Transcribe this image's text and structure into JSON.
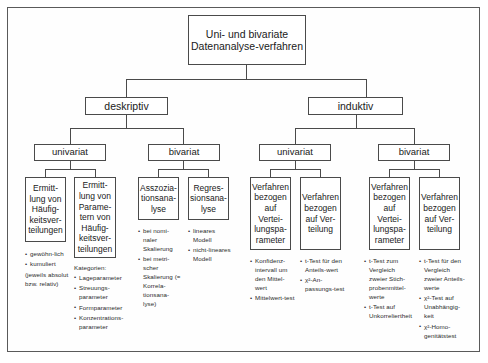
{
  "diagram": {
    "title_box": "Uni- und bivariate Datenanalyse-verfahren",
    "level1": [
      {
        "label": "deskriptiv"
      },
      {
        "label": "induktiv"
      }
    ],
    "level2": [
      {
        "label": "univariat"
      },
      {
        "label": "bivariat"
      },
      {
        "label": "univariat"
      },
      {
        "label": "bivariat"
      }
    ],
    "leaves": [
      {
        "label": "Ermitt-lung von Häufig-keitsver-teilungen"
      },
      {
        "label": "Ermitt-lung von Parame-tern von Häufig-keitsver-teilungen"
      },
      {
        "label": "Asszozia-tionsana-lyse"
      },
      {
        "label": "Regres-sionsana-lyse"
      },
      {
        "label": "Verfahren bezogen auf Vertei-lungspa-rameter"
      },
      {
        "label": "Verfahren bezogen auf Ver-teilung"
      },
      {
        "label": "Verfahren bezogen auf Vertei-lungspa-rameter"
      },
      {
        "label": "Verfahren bezogen auf Ver-teilung"
      }
    ],
    "notes": [
      {
        "heading": "",
        "items": [
          "gewöhn-lich",
          "kumuliert"
        ],
        "trailing": "(jeweils absolut bzw. relativ)"
      },
      {
        "heading": "Kategorien:",
        "items": [
          "Lageparameter",
          "Streuungs-parameter",
          "Formparameter",
          "Konzentrations-parameter"
        ],
        "trailing": ""
      },
      {
        "heading": "",
        "items": [
          "bei nomi-naler Skalierung",
          "bei metri-scher Skalierung (= Korrela-tionsana-lyse)"
        ],
        "trailing": ""
      },
      {
        "heading": "",
        "items": [
          "lineares Modell",
          "nicht-lineares Modell"
        ],
        "trailing": ""
      },
      {
        "heading": "",
        "items": [
          "Konfidenz-intervall um den Mittel-wert",
          "Mittelwert-test"
        ],
        "trailing": ""
      },
      {
        "heading": "",
        "items": [
          "t-Test für den Anteils-wert",
          "χ²-An-passungs-test"
        ],
        "trailing": ""
      },
      {
        "heading": "",
        "items": [
          "t-Test zum Vergleich zweier Stich-probenmittel-werte",
          "t-Test auf Unkorreliertheit"
        ],
        "trailing": ""
      },
      {
        "heading": "",
        "items": [
          "t-Test für den Vergleich zweier Anteils-werte",
          "χ²-Test auf Unabhängig-keit",
          "χ²-Homo-genitätstest"
        ],
        "trailing": ""
      }
    ]
  }
}
